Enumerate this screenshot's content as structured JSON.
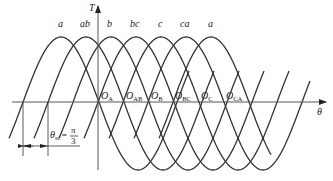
{
  "diagram": {
    "axes": {
      "y_label": "T",
      "x_label": "θ"
    },
    "curve_labels": [
      "a",
      "ab",
      "b",
      "bc",
      "c",
      "ca",
      "a"
    ],
    "intersection_points": [
      {
        "main": "O",
        "sub": "A"
      },
      {
        "main": "O",
        "sub": "AB"
      },
      {
        "main": "O",
        "sub": "B"
      },
      {
        "main": "O",
        "sub": "BC"
      },
      {
        "main": "O",
        "sub": "C"
      },
      {
        "main": "O",
        "sub": "CA"
      }
    ],
    "annotation": {
      "symbol": "θ",
      "subscript": "sc",
      "equals": "=",
      "numerator": "π",
      "denominator": "3"
    },
    "colors": {
      "stroke": "#333333",
      "axis": "#555555",
      "background": "#ffffff"
    }
  }
}
